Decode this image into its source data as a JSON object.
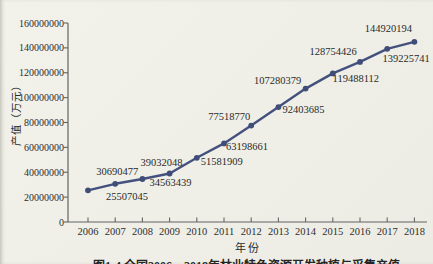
{
  "colors": {
    "background": "#f1f0e9",
    "line": "#44517e",
    "marker": "#404d78",
    "axis": "#636363",
    "text": "#2b2b2b"
  },
  "chart_data": {
    "type": "line",
    "title": "图1-4 全国2006—2018年林业特色资源开发种植与采集产值",
    "xlabel": "年份",
    "ylabel": "产值（万元）",
    "categories": [
      "2006",
      "2007",
      "2008",
      "2009",
      "2010",
      "2011",
      "2012",
      "2013",
      "2014",
      "2015",
      "2016",
      "2017",
      "2018"
    ],
    "values": [
      25507045,
      30690477,
      34563439,
      39032048,
      51581909,
      63198661,
      77518770,
      92403685,
      107280379,
      119488112,
      128754426,
      139225741,
      144920194
    ],
    "data_labels": [
      "25507045",
      "30690477",
      "34563439",
      "39032048",
      "51581909",
      "63198661",
      "77518770",
      "92403685",
      "107280379",
      "119488112",
      "128754426",
      "139225741",
      "144920194"
    ],
    "ylim": [
      0,
      160000000
    ],
    "y_ticks": [
      "0",
      "20000000",
      "40000000",
      "60000000",
      "80000000",
      "100000000",
      "120000000",
      "140000000",
      "160000000"
    ],
    "grid": false,
    "legend": "none",
    "label_offsets": [
      [
        39,
        7
      ],
      [
        2,
        -12
      ],
      [
        28,
        4
      ],
      [
        -8,
        -10
      ],
      [
        25,
        4
      ],
      [
        23,
        4
      ],
      [
        -22,
        -9
      ],
      [
        25,
        3
      ],
      [
        -28,
        -8
      ],
      [
        23,
        6
      ],
      [
        -27,
        -10
      ],
      [
        19,
        10
      ],
      [
        -26,
        -13
      ]
    ]
  }
}
